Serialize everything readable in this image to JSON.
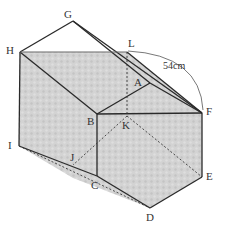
{
  "diagram": {
    "type": "3d-solid-net-figure",
    "colors": {
      "edge": "#2a2a2a",
      "hidden_edge": "#3a3a3a",
      "shade": "#cfcfcf",
      "shade_light": "#dadada",
      "background": "#ffffff"
    },
    "vertex_labels": {
      "G": "G",
      "H": "H",
      "L": "L",
      "A": "A",
      "B": "B",
      "K": "K",
      "F": "F",
      "I": "I",
      "J": "J",
      "C": "C",
      "E": "E",
      "D": "D"
    },
    "dimension": {
      "label": "54cm",
      "from": "L",
      "to": "F"
    }
  }
}
